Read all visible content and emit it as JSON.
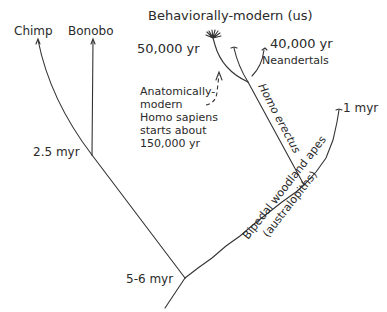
{
  "title": "Behaviorally-modern (us)",
  "taxa": {
    "chimp": "Chimp",
    "bonobo": "Bonobo",
    "neandertals": "Neandertals"
  },
  "times": {
    "behaviorally_modern": "50,000 yr",
    "neandertal_extinction": "40,000 yr",
    "australopith_end": "1 myr",
    "chimp_bonobo_split": "2.5 myr",
    "root_split": "5-6 myr"
  },
  "branch_labels": {
    "homo_erectus": "Homo erectus",
    "bipedal_line1": "Bipedal woodland apes",
    "bipedal_line2": "(australopiths)"
  },
  "annotation": {
    "lines": [
      "Anatomically-",
      "modern",
      "Homo sapiens",
      "starts about",
      "150,000 yr"
    ]
  },
  "colors": {
    "line": "#333333",
    "text": "#2a2a2a",
    "background": "#ffffff"
  }
}
